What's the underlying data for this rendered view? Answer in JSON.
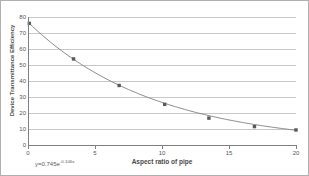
{
  "chart_data": {
    "type": "scatter",
    "title": "",
    "xlabel": "Aspect ratio of pipe",
    "ylabel": "Device Transmittance Efficiency",
    "xlim": [
      0,
      20
    ],
    "ylim": [
      0,
      80
    ],
    "xticks": [
      0,
      5,
      10,
      15,
      20
    ],
    "yticks": [
      0,
      10,
      20,
      30,
      40,
      50,
      60,
      70,
      80
    ],
    "grid": "horizontal",
    "legend": "none",
    "marker": "square",
    "series": [
      {
        "name": "Device Transmittance Efficiency",
        "x": [
          0.1,
          3.4,
          6.8,
          10.2,
          13.5,
          16.9,
          20.0
        ],
        "values": [
          76.0,
          53.8,
          37.2,
          25.4,
          16.8,
          11.5,
          9.4
        ]
      }
    ],
    "trendline": {
      "type": "exponential",
      "equation_prefix": "y=0.745e",
      "equation_exponent": "-0.106x",
      "coefficient": 0.745,
      "rate": -0.106,
      "x_start": 0,
      "x_end": 20
    },
    "annotations": [
      {
        "name": "trendline-equation",
        "text": "y=0.745e-0.106x"
      }
    ],
    "colors": {
      "marker": "#595959",
      "line": "#7f7f7f",
      "gridline": "#c8c8c8",
      "axis": "#808080",
      "text": "#555555",
      "border": "#b0b0b0",
      "background": "#ffffff"
    }
  }
}
